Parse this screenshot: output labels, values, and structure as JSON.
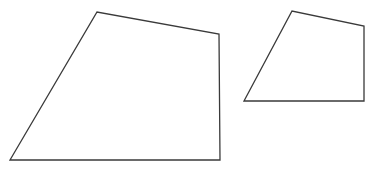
{
  "figure": {
    "background_color": "#ffffff",
    "width": 376,
    "height": 170,
    "stroke_color": "#3a3a3a",
    "stroke_width": 1.3,
    "fill": "none",
    "shapes": [
      {
        "id": "large-quadrilateral",
        "name": "large-quadrilateral",
        "label": "Large quadrilateral",
        "type": "polygon",
        "sides": 4,
        "closed": true,
        "fill": "none",
        "stroke_color": "#3a3a3a",
        "stroke_width": 1.3,
        "points": "10,160 97,12 219,34 220,160",
        "vertices": [
          {
            "name": "bottom-left",
            "x": 10,
            "y": 160
          },
          {
            "name": "top-apex",
            "x": 97,
            "y": 12
          },
          {
            "name": "top-right",
            "x": 219,
            "y": 34
          },
          {
            "name": "bottom-right",
            "x": 220,
            "y": 160
          }
        ],
        "edges": [
          {
            "name": "left-slanted-edge",
            "from": "bottom-left",
            "to": "top-apex"
          },
          {
            "name": "top-slanted-edge",
            "from": "top-apex",
            "to": "top-right"
          },
          {
            "name": "right-vertical-edge",
            "from": "top-right",
            "to": "bottom-right"
          },
          {
            "name": "bottom-horizontal-edge",
            "from": "bottom-right",
            "to": "bottom-left"
          }
        ]
      },
      {
        "id": "small-quadrilateral",
        "name": "small-quadrilateral",
        "label": "Small quadrilateral",
        "type": "polygon",
        "sides": 4,
        "closed": true,
        "fill": "none",
        "stroke_color": "#3a3a3a",
        "stroke_width": 1.3,
        "points": "244,101 292,11 364,26 364,101",
        "vertices": [
          {
            "name": "bottom-left",
            "x": 244,
            "y": 101
          },
          {
            "name": "top-apex",
            "x": 292,
            "y": 11
          },
          {
            "name": "top-right",
            "x": 364,
            "y": 26
          },
          {
            "name": "bottom-right",
            "x": 364,
            "y": 101
          }
        ],
        "edges": [
          {
            "name": "left-slanted-edge",
            "from": "bottom-left",
            "to": "top-apex"
          },
          {
            "name": "top-slanted-edge",
            "from": "top-apex",
            "to": "top-right"
          },
          {
            "name": "right-vertical-edge",
            "from": "top-right",
            "to": "bottom-right"
          },
          {
            "name": "bottom-horizontal-edge",
            "from": "bottom-right",
            "to": "bottom-left"
          }
        ]
      }
    ]
  }
}
